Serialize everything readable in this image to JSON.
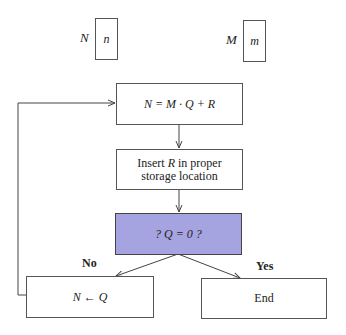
{
  "variables": [
    {
      "label": "N",
      "value": "n"
    },
    {
      "label": "M",
      "value": "m"
    }
  ],
  "flow": {
    "step1": "N = M · Q + R",
    "step2_pre": "Insert ",
    "step2_var": "R",
    "step2_post": " in proper storage location",
    "decision": "? Q = 0 ?",
    "branch_no": "No",
    "branch_yes": "Yes",
    "no_action": "N ← Q",
    "yes_action": "End"
  },
  "colors": {
    "decision_fill": "#a6a4e0",
    "stroke": "#555555"
  }
}
